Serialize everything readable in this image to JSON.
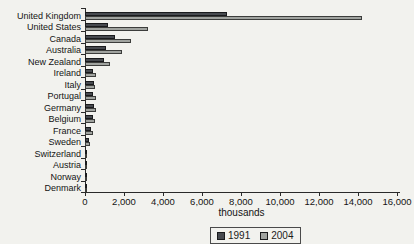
{
  "chart_data": {
    "type": "bar",
    "orientation": "horizontal",
    "title": "",
    "xlabel": "thousands",
    "xlim": [
      0,
      16000
    ],
    "grid": false,
    "legend_position": "bottom",
    "x_ticks": [
      {
        "value": 0,
        "label": "0"
      },
      {
        "value": 2000,
        "label": "2,000"
      },
      {
        "value": 4000,
        "label": "4,000"
      },
      {
        "value": 6000,
        "label": "6,000"
      },
      {
        "value": 8000,
        "label": "8,000"
      },
      {
        "value": 10000,
        "label": "10,000"
      },
      {
        "value": 12000,
        "label": "12,000"
      },
      {
        "value": 14000,
        "label": "14,000"
      },
      {
        "value": 16000,
        "label": "16,000"
      }
    ],
    "categories": [
      "United Kingdom",
      "United States",
      "Canada",
      "Australia",
      "New Zealand",
      "Ireland",
      "Italy",
      "Portugal",
      "Germany",
      "Belgium",
      "France",
      "Sweden",
      "Switzerland",
      "Austria",
      "Norway",
      "Denmark"
    ],
    "series": [
      {
        "name": "1991",
        "color": "#474a4f",
        "border_color": "#1a1b1d",
        "values": [
          7300,
          1200,
          1550,
          1080,
          950,
          400,
          450,
          430,
          470,
          420,
          300,
          200,
          70,
          50,
          45,
          40
        ]
      },
      {
        "name": "2004",
        "color": "#a0a39f",
        "border_color": "#3c3d3b",
        "values": [
          14200,
          3250,
          2350,
          1900,
          1300,
          550,
          520,
          580,
          540,
          490,
          390,
          250,
          90,
          60,
          55,
          50
        ]
      }
    ]
  }
}
